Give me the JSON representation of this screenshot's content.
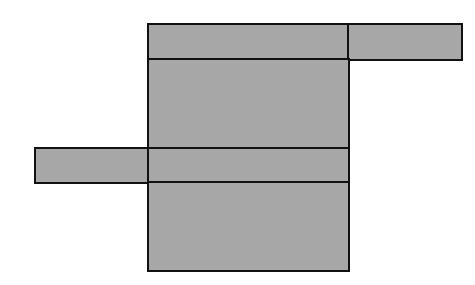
{
  "diagram": {
    "type": "rectangle-layout",
    "fill_color": "#a7a7a7",
    "border_color": "#111111",
    "background": "#ffffff",
    "cells": [
      {
        "name": "main-top-cell",
        "x": 147,
        "y": 23,
        "w": 203,
        "h": 38
      },
      {
        "name": "top-right-cell",
        "x": 347,
        "y": 23,
        "w": 116,
        "h": 38
      },
      {
        "name": "main-upper-middle-cell",
        "x": 147,
        "y": 58,
        "w": 203,
        "h": 92
      },
      {
        "name": "left-cell",
        "x": 34,
        "y": 147,
        "w": 116,
        "h": 37
      },
      {
        "name": "main-lower-middle-cell",
        "x": 147,
        "y": 147,
        "w": 203,
        "h": 37
      },
      {
        "name": "main-bottom-cell",
        "x": 147,
        "y": 181,
        "w": 203,
        "h": 91
      }
    ]
  }
}
